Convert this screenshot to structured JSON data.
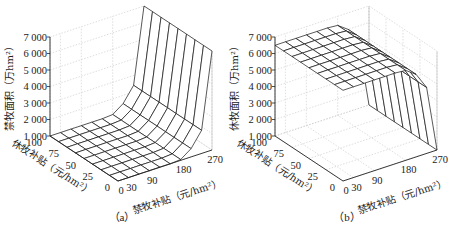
{
  "chart_data": [
    {
      "type": "surface3d",
      "panel": "a",
      "caption": "（a）",
      "zlabel": "禁牧面积（万hm²）",
      "xlabel": "禁牧补贴（元/hm²）",
      "ylabel": "休牧补贴（元/hm²）",
      "xticks": [
        "0",
        "30",
        "90",
        "180",
        "270"
      ],
      "yticks": [
        "0",
        "25",
        "50",
        "75",
        "100"
      ],
      "zticks": [
        "1 000",
        "2 000",
        "3 000",
        "4 000",
        "5 000",
        "6 000",
        "7 000"
      ],
      "xlim": [
        0,
        270
      ],
      "ylim": [
        0,
        100
      ],
      "zlim": [
        1000,
        7000
      ],
      "x": [
        0,
        30,
        60,
        90,
        120,
        150,
        180,
        210,
        240,
        270
      ],
      "y": [
        0,
        12.5,
        25,
        37.5,
        50,
        62.5,
        75,
        87.5,
        100
      ],
      "description": "Flat near 1000 for low 禁牧补贴; rises to ~7000 at 禁牧补贴 = 270 across all 休牧补贴 values",
      "z_by_x": [
        1000,
        1000,
        1000,
        1000,
        1000,
        1000,
        1050,
        1500,
        2400,
        7000
      ],
      "grid": true
    },
    {
      "type": "surface3d",
      "panel": "b",
      "caption": "（b）",
      "zlabel": "休牧面积（万hm²）",
      "xlabel": "禁牧补贴（元/hm²）",
      "ylabel": "休牧补贴（元/hm²）",
      "xticks": [
        "0",
        "30",
        "90",
        "180",
        "270"
      ],
      "yticks": [
        "0",
        "25",
        "50",
        "75",
        "100"
      ],
      "zticks": [
        "1 000",
        "2 000",
        "3 000",
        "4 000",
        "5 000",
        "6 000",
        "7 000"
      ],
      "xlim": [
        0,
        270
      ],
      "ylim": [
        0,
        100
      ],
      "zlim": [
        1000,
        7000
      ],
      "x": [
        0,
        30,
        60,
        90,
        120,
        150,
        180,
        210,
        240,
        270
      ],
      "y": [
        0,
        12.5,
        25,
        37.5,
        50,
        62.5,
        75,
        87.5,
        100
      ],
      "description": "Plateau near 6500 for low 禁牧补贴; drops to ~0 at 禁牧补贴 = 270 across all 休牧补贴 values",
      "z_by_x": [
        6500,
        6500,
        6500,
        6500,
        6500,
        6500,
        6450,
        6000,
        5000,
        300
      ],
      "grid": true
    }
  ]
}
